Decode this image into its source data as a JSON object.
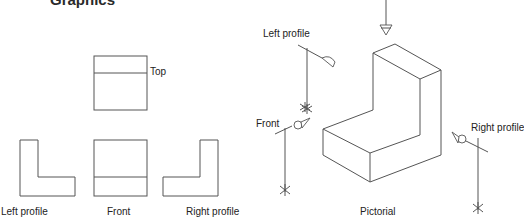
{
  "heading": "Graphics",
  "orthographic_views": {
    "top": "Top",
    "left_profile": "Left profile",
    "front": "Front",
    "right_profile": "Right profile"
  },
  "pictorial": {
    "caption": "Pictorial",
    "viewer_labels": {
      "left_profile": "Left profile",
      "front": "Front",
      "right_profile": "Right profile"
    }
  }
}
